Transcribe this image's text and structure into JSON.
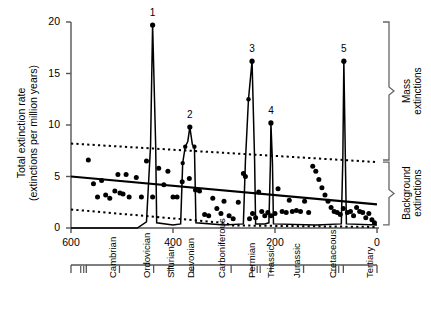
{
  "chart_data": {
    "type": "line",
    "title": "",
    "xlabel": "",
    "ylabel_line1": "Total extinction rate",
    "ylabel_line2": "(extinctions per million years)",
    "xlim": [
      600,
      0
    ],
    "ylim": [
      0,
      20
    ],
    "x_ticks": [
      600,
      400,
      200,
      0
    ],
    "x_tick_labels": [
      "600",
      "400",
      "200",
      "0"
    ],
    "y_ticks": [
      0,
      5,
      10,
      15,
      20
    ],
    "y_tick_labels": [
      "0",
      "5",
      "10",
      "15",
      "20"
    ],
    "grid": false,
    "legend_position": "right-brackets",
    "annotations": [
      {
        "label": "1",
        "x": 440,
        "y": 19.7
      },
      {
        "label": "2",
        "x": 367,
        "y": 9.8
      },
      {
        "label": "3",
        "x": 245,
        "y": 16.2
      },
      {
        "label": "4",
        "x": 208,
        "y": 10.2
      },
      {
        "label": "5",
        "x": 65,
        "y": 16.2
      }
    ],
    "brackets": [
      {
        "name": "mass-extinctions",
        "label_line1": "Mass",
        "label_line2": "extinctions",
        "y_from": 6.6,
        "y_to": 20.0
      },
      {
        "name": "background-extinctions",
        "label_line1": "Background",
        "label_line2": "extinctions",
        "y_from": 0.3,
        "y_to": 6.4
      }
    ],
    "series": [
      {
        "name": "extinction-rate-curve",
        "style": "solid-spike",
        "points": [
          [
            600,
            0.0
          ],
          [
            470,
            0.0
          ],
          [
            452,
            0.6
          ],
          [
            444,
            8.0
          ],
          [
            440,
            19.7
          ],
          [
            434,
            8.1
          ],
          [
            432,
            0.5
          ],
          [
            400,
            0.3
          ],
          [
            385,
            0.4
          ],
          [
            381,
            6.3
          ],
          [
            376,
            7.9
          ],
          [
            371,
            8.4
          ],
          [
            367,
            9.8
          ],
          [
            362,
            8.1
          ],
          [
            358,
            7.9
          ],
          [
            355,
            0.5
          ],
          [
            300,
            0.3
          ],
          [
            262,
            0.4
          ],
          [
            258,
            6.5
          ],
          [
            252,
            12.5
          ],
          [
            245,
            16.2
          ],
          [
            240,
            6.6
          ],
          [
            238,
            0.4
          ],
          [
            220,
            0.4
          ],
          [
            212,
            0.5
          ],
          [
            209,
            6.3
          ],
          [
            208,
            10.2
          ],
          [
            205,
            6.3
          ],
          [
            203,
            0.4
          ],
          [
            120,
            0.3
          ],
          [
            70,
            0.4
          ],
          [
            67,
            6.7
          ],
          [
            65,
            16.2
          ],
          [
            62,
            6.6
          ],
          [
            60,
            0.4
          ],
          [
            0,
            0.3
          ]
        ]
      },
      {
        "name": "regression-line",
        "style": "solid",
        "points": [
          [
            600,
            5.0
          ],
          [
            0,
            2.3
          ]
        ]
      },
      {
        "name": "upper-confidence-band",
        "style": "dashed",
        "points": [
          [
            600,
            8.2
          ],
          [
            0,
            6.4
          ]
        ]
      },
      {
        "name": "lower-confidence-band",
        "style": "dashed",
        "points": [
          [
            600,
            1.8
          ],
          [
            300,
            0.5
          ],
          [
            285,
            0.25
          ],
          [
            0,
            0.1
          ]
        ]
      },
      {
        "name": "background-extinction-points",
        "style": "scatter",
        "points": [
          [
            566,
            6.6
          ],
          [
            556,
            4.3
          ],
          [
            548,
            3.0
          ],
          [
            540,
            4.6
          ],
          [
            532,
            3.2
          ],
          [
            524,
            2.9
          ],
          [
            514,
            3.6
          ],
          [
            508,
            5.2
          ],
          [
            504,
            3.4
          ],
          [
            498,
            3.3
          ],
          [
            492,
            5.2
          ],
          [
            486,
            3.0
          ],
          [
            472,
            4.9
          ],
          [
            462,
            3.0
          ],
          [
            452,
            6.5
          ],
          [
            440,
            3.0
          ],
          [
            428,
            5.8
          ],
          [
            418,
            4.2
          ],
          [
            410,
            5.5
          ],
          [
            400,
            3.0
          ],
          [
            392,
            3.0
          ],
          [
            382,
            4.5
          ],
          [
            368,
            4.8
          ],
          [
            356,
            3.7
          ],
          [
            348,
            3.6
          ],
          [
            338,
            1.3
          ],
          [
            330,
            1.2
          ],
          [
            322,
            2.9
          ],
          [
            314,
            1.9
          ],
          [
            306,
            1.4
          ],
          [
            300,
            2.6
          ],
          [
            290,
            1.2
          ],
          [
            282,
            0.9
          ],
          [
            272,
            2.5
          ],
          [
            262,
            5.3
          ],
          [
            258,
            5.0
          ],
          [
            250,
            0.9
          ],
          [
            244,
            1.4
          ],
          [
            238,
            1.0
          ],
          [
            232,
            3.5
          ],
          [
            226,
            1.6
          ],
          [
            220,
            1.2
          ],
          [
            214,
            1.5
          ],
          [
            208,
            1.2
          ],
          [
            200,
            1.4
          ],
          [
            194,
            3.8
          ],
          [
            186,
            1.6
          ],
          [
            178,
            1.5
          ],
          [
            172,
            2.7
          ],
          [
            166,
            1.6
          ],
          [
            158,
            1.7
          ],
          [
            150,
            1.6
          ],
          [
            142,
            2.6
          ],
          [
            134,
            1.5
          ],
          [
            126,
            6.0
          ],
          [
            120,
            5.5
          ],
          [
            114,
            4.7
          ],
          [
            108,
            3.9
          ],
          [
            102,
            3.2
          ],
          [
            96,
            2.6
          ],
          [
            90,
            2.0
          ],
          [
            84,
            1.6
          ],
          [
            78,
            1.5
          ],
          [
            72,
            1.3
          ],
          [
            66,
            1.9
          ],
          [
            58,
            1.5
          ],
          [
            52,
            1.6
          ],
          [
            46,
            1.2
          ],
          [
            40,
            2.0
          ],
          [
            34,
            1.6
          ],
          [
            28,
            1.5
          ],
          [
            22,
            1.0
          ],
          [
            16,
            1.4
          ],
          [
            10,
            0.8
          ],
          [
            5,
            0.5
          ]
        ]
      }
    ],
    "periods": [
      {
        "name": "Cambrian",
        "start": 570,
        "end": 505
      },
      {
        "name": "Ordovician",
        "start": 505,
        "end": 438
      },
      {
        "name": "Silurian",
        "start": 438,
        "end": 408
      },
      {
        "name": "Devonian",
        "start": 408,
        "end": 360
      },
      {
        "name": "Carboniferous",
        "start": 360,
        "end": 286
      },
      {
        "name": "Permian",
        "start": 286,
        "end": 245
      },
      {
        "name": "Triassic",
        "start": 245,
        "end": 208
      },
      {
        "name": "Jurassic",
        "start": 208,
        "end": 144
      },
      {
        "name": "Cretaceous",
        "start": 144,
        "end": 66
      },
      {
        "name": "Tertiary",
        "start": 66,
        "end": 2
      }
    ],
    "colors": {
      "axis": "#555555",
      "data": "#000000",
      "bracket": "#666666"
    }
  }
}
